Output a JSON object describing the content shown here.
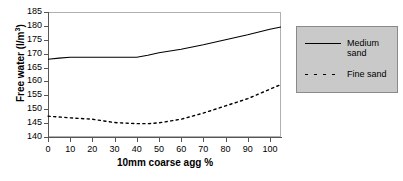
{
  "chart_data": {
    "type": "line",
    "title": "",
    "xlabel": "10mm coarse agg %",
    "ylabel": "Free water  (l/m3)",
    "ylabel_base": "Free water  (l/m",
    "ylabel_sup": "3",
    "ylabel_close": ")",
    "xlim": [
      0,
      105
    ],
    "ylim": [
      140,
      185
    ],
    "grid": false,
    "legend_position": "right",
    "xticks": [
      0,
      10,
      20,
      30,
      40,
      50,
      60,
      70,
      80,
      90,
      100
    ],
    "yticks": [
      140,
      145,
      150,
      155,
      160,
      165,
      170,
      175,
      180,
      185
    ],
    "x": [
      0,
      5,
      10,
      20,
      30,
      40,
      45,
      50,
      60,
      70,
      80,
      90,
      100,
      105
    ],
    "series": [
      {
        "name": "Medium sand",
        "style": "solid",
        "color": "#000000",
        "values": [
          168.0,
          168.4,
          168.7,
          168.7,
          168.7,
          168.7,
          169.4,
          170.3,
          171.6,
          173.2,
          175.0,
          176.8,
          178.8,
          179.6
        ]
      },
      {
        "name": "Fine sand",
        "style": "dotted",
        "color": "#000000",
        "values": [
          147.5,
          147.2,
          146.9,
          146.4,
          145.2,
          144.8,
          144.8,
          145.1,
          146.4,
          148.6,
          151.2,
          153.8,
          157.2,
          158.9
        ]
      }
    ]
  },
  "legend": {
    "items": [
      {
        "label": "Medium\nsand",
        "style": "solid"
      },
      {
        "label": "Fine sand",
        "style": "dotted"
      }
    ]
  }
}
